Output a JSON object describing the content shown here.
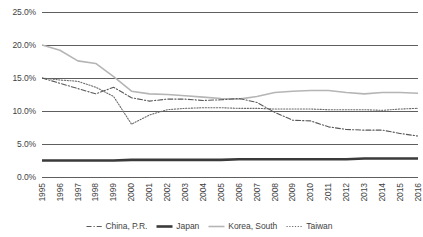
{
  "chart_data": {
    "type": "line",
    "title": "",
    "xlabel": "",
    "ylabel": "",
    "grid": true,
    "legend_position": "bottom",
    "ylim": [
      0,
      25
    ],
    "y_ticks": [
      "0.0%",
      "5.0%",
      "10.0%",
      "15.0%",
      "20.0%",
      "25.0%"
    ],
    "y_tick_values": [
      0,
      5,
      10,
      15,
      20,
      25
    ],
    "categories": [
      "1995",
      "1996",
      "1997",
      "1998",
      "1999",
      "2000",
      "2001",
      "2002",
      "2003",
      "2004",
      "2005",
      "2006",
      "2007",
      "2008",
      "2009",
      "2010",
      "2011",
      "2012",
      "2013",
      "2014",
      "2015",
      "2016"
    ],
    "series": [
      {
        "name": "China, P.R.",
        "style": "dash-dot",
        "color": "#595959",
        "values": [
          15.0,
          14.2,
          13.4,
          12.6,
          13.6,
          12.0,
          11.5,
          11.8,
          11.8,
          11.6,
          11.7,
          11.9,
          11.3,
          9.8,
          8.6,
          8.5,
          7.6,
          7.2,
          7.1,
          7.1,
          6.6,
          6.2
        ]
      },
      {
        "name": "Japan",
        "style": "thick-solid",
        "color": "#3a3a3a",
        "values": [
          2.5,
          2.5,
          2.5,
          2.5,
          2.5,
          2.6,
          2.6,
          2.6,
          2.6,
          2.6,
          2.6,
          2.7,
          2.7,
          2.7,
          2.7,
          2.7,
          2.7,
          2.7,
          2.8,
          2.8,
          2.8,
          2.8
        ]
      },
      {
        "name": "Korea, South",
        "style": "solid",
        "color": "#b5b5b5",
        "values": [
          20.0,
          19.2,
          17.6,
          17.2,
          15.2,
          13.0,
          12.6,
          12.5,
          12.3,
          12.1,
          11.9,
          11.8,
          12.2,
          12.8,
          13.0,
          13.1,
          13.1,
          12.8,
          12.6,
          12.8,
          12.8,
          12.7
        ]
      },
      {
        "name": "Taiwan",
        "style": "dotted",
        "color": "#6b6b6b",
        "values": [
          15.0,
          14.7,
          14.5,
          13.6,
          12.2,
          8.0,
          9.4,
          10.2,
          10.4,
          10.5,
          10.5,
          10.4,
          10.4,
          10.3,
          10.3,
          10.3,
          10.2,
          10.2,
          10.2,
          10.1,
          10.3,
          10.4
        ]
      }
    ]
  },
  "legend": {
    "items": [
      {
        "label": "China, P.R.",
        "icon": "line-dash-dot-swatch"
      },
      {
        "label": "Japan",
        "icon": "line-thick-swatch"
      },
      {
        "label": "Korea, South",
        "icon": "line-solid-swatch"
      },
      {
        "label": "Taiwan",
        "icon": "line-dotted-swatch"
      }
    ]
  }
}
